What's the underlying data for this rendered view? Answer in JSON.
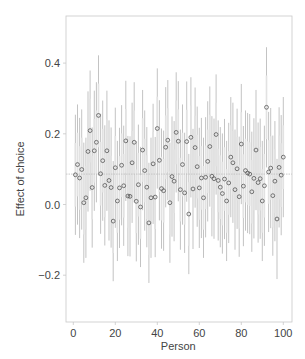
{
  "chart_data": {
    "type": "scatter",
    "subtype": "point-with-error-bars",
    "title": "",
    "xlabel": "Person",
    "ylabel": "Effect of choice",
    "xlim": [
      -3,
      103
    ],
    "ylim": [
      -0.33,
      0.53
    ],
    "xticks": [
      0,
      20,
      40,
      60,
      80,
      100
    ],
    "xtick_labels": [
      "0",
      "20",
      "40",
      "60",
      "80",
      "100"
    ],
    "yticks": [
      -0.2,
      0.0,
      0.2,
      0.4
    ],
    "ytick_labels": [
      "−0.2",
      "0.0",
      "0.2",
      "0.4"
    ],
    "grid": false,
    "legend": null,
    "reference_line": {
      "y": 0.086,
      "style": "dotted",
      "label": "mean effect"
    },
    "interval_halfwidth_outer": 0.17,
    "interval_halfwidth_inner": 0.09,
    "x": [
      1,
      2,
      3,
      4,
      5,
      6,
      7,
      8,
      9,
      10,
      11,
      12,
      13,
      14,
      15,
      16,
      17,
      18,
      19,
      20,
      21,
      22,
      23,
      24,
      25,
      26,
      27,
      28,
      29,
      30,
      31,
      32,
      33,
      34,
      35,
      36,
      37,
      38,
      39,
      40,
      41,
      42,
      43,
      44,
      45,
      46,
      47,
      48,
      49,
      50,
      51,
      52,
      53,
      54,
      55,
      56,
      57,
      58,
      59,
      60,
      61,
      62,
      63,
      64,
      65,
      66,
      67,
      68,
      69,
      70,
      71,
      72,
      73,
      74,
      75,
      76,
      77,
      78,
      79,
      80,
      81,
      82,
      83,
      84,
      85,
      86,
      87,
      88,
      89,
      90,
      91,
      92,
      93,
      94,
      95,
      96,
      97,
      98,
      99,
      100
    ],
    "values": [
      0.084,
      0.113,
      0.075,
      0.099,
      0.005,
      0.019,
      0.15,
      0.209,
      0.048,
      0.152,
      0.176,
      0.252,
      0.087,
      0.124,
      0.054,
      0.152,
      0.068,
      0.048,
      -0.047,
      0.104,
      0.01,
      0.047,
      0.111,
      0.053,
      0.18,
      0.024,
      0.023,
      0.118,
      0.176,
      0.009,
      0.056,
      -0.007,
      0.154,
      0.096,
      0.049,
      -0.052,
      0.019,
      0.115,
      0.021,
      0.215,
      0.125,
      0.045,
      0.039,
      0.162,
      0.182,
      0.005,
      0.079,
      0.066,
      0.204,
      0.179,
      0.042,
      0.113,
      0.033,
      0.178,
      -0.027,
      0.19,
      0.044,
      0.161,
      0.107,
      0.047,
      0.075,
      0.019,
      0.077,
      0.122,
      0.164,
      0.08,
      0.073,
      0.198,
      0.068,
      0.049,
      0.031,
      0.072,
      0.01,
      0.061,
      0.134,
      0.118,
      0.042,
      0.101,
      0.022,
      0.171,
      0.052,
      0.096,
      0.089,
      0.086,
      0.036,
      0.074,
      0.154,
      0.062,
      0.073,
      0.01,
      0.053,
      0.275,
      0.092,
      0.103,
      0.025,
      0.066,
      -0.041,
      0.105,
      0.083,
      0.134
    ]
  },
  "colors": {
    "background": "#ffffff",
    "axis": "#c8c8c8",
    "outer_bar": "#b4b4b4",
    "inner_band": "#e2e2e2",
    "point_stroke": "#555555",
    "mean_line": "#bdbdbd",
    "text": "#444444"
  }
}
